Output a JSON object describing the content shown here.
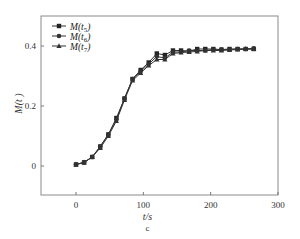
{
  "chart_data": {
    "type": "line",
    "title": "",
    "caption": "c",
    "xlabel": "t/s",
    "ylabel": "M(t)",
    "xlim": [
      -50,
      300
    ],
    "ylim": [
      -0.12,
      0.48
    ],
    "xticks": [
      0,
      100,
      200,
      300
    ],
    "yticks": [
      0,
      0.2,
      0.4
    ],
    "xtick_labels": [
      "0",
      "100",
      "200",
      "300"
    ],
    "ytick_labels": [
      "0",
      "0.2",
      "0.4"
    ],
    "grid": false,
    "legend_position": "upper left",
    "x": [
      0,
      12,
      24,
      36,
      48,
      60,
      72,
      84,
      96,
      108,
      120,
      132,
      144,
      156,
      168,
      180,
      192,
      204,
      216,
      228,
      240,
      252,
      264
    ],
    "series": [
      {
        "name": "M(t5)",
        "marker": "square",
        "values": [
          0.005,
          0.012,
          0.03,
          0.065,
          0.105,
          0.16,
          0.225,
          0.29,
          0.32,
          0.345,
          0.375,
          0.37,
          0.385,
          0.385,
          0.383,
          0.39,
          0.39,
          0.39,
          0.388,
          0.39,
          0.39,
          0.39,
          0.39
        ]
      },
      {
        "name": "M(t6)",
        "marker": "circle",
        "values": [
          0.005,
          0.012,
          0.03,
          0.065,
          0.105,
          0.155,
          0.225,
          0.29,
          0.315,
          0.34,
          0.365,
          0.36,
          0.38,
          0.38,
          0.385,
          0.385,
          0.385,
          0.388,
          0.388,
          0.388,
          0.39,
          0.39,
          0.392
        ]
      },
      {
        "name": "M(t7)",
        "marker": "triangle",
        "values": [
          0.005,
          0.012,
          0.03,
          0.06,
          0.1,
          0.15,
          0.22,
          0.285,
          0.31,
          0.335,
          0.355,
          0.355,
          0.375,
          0.378,
          0.38,
          0.382,
          0.385,
          0.385,
          0.385,
          0.387,
          0.388,
          0.39,
          0.39
        ]
      }
    ]
  },
  "legend": [
    {
      "label": "M(t5)",
      "sub": "5"
    },
    {
      "label": "M(t6)",
      "sub": "6"
    },
    {
      "label": "M(t7)",
      "sub": "7"
    }
  ]
}
